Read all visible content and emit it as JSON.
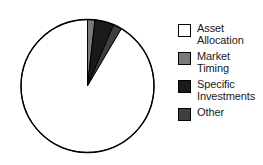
{
  "chart_data": {
    "type": "pie",
    "title": "",
    "subtitle": "",
    "xlabel": "",
    "ylabel": "",
    "grid": false,
    "legend_position": "right",
    "start_angle_deg": 90,
    "direction": "clockwise",
    "categories": [
      "Asset Allocation",
      "Market Timing",
      "Specific Investments",
      "Other"
    ],
    "values": [
      91.5,
      1.8,
      4.6,
      2.1
    ],
    "units": "percent",
    "colors": [
      "#ffffff",
      "#7a7a7a",
      "#1a1a1a",
      "#3f3f3f"
    ],
    "edge_color": "#000000",
    "slices": [
      {
        "label": "Asset Allocation",
        "value": 91.5,
        "color": "#ffffff",
        "order": 4
      },
      {
        "label": "Market Timing",
        "value": 1.8,
        "color": "#7a7a7a",
        "order": 1
      },
      {
        "label": "Specific Investments",
        "value": 4.6,
        "color": "#1a1a1a",
        "order": 2
      },
      {
        "label": "Other",
        "value": 2.1,
        "color": "#3f3f3f",
        "order": 3
      }
    ]
  },
  "legend": {
    "items": [
      {
        "label": "Asset\nAllocation",
        "swatch": "#ffffff",
        "name": "asset-allocation"
      },
      {
        "label": "Market\nTiming",
        "swatch": "#7a7a7a",
        "name": "market-timing"
      },
      {
        "label": "Specific\nInvestments",
        "swatch": "#1a1a1a",
        "name": "specific-investments"
      },
      {
        "label": "Other",
        "swatch": "#3f3f3f",
        "name": "other"
      }
    ]
  },
  "geometry": {
    "center_x": 87.5,
    "center_y": 86,
    "radius": 66.5
  }
}
